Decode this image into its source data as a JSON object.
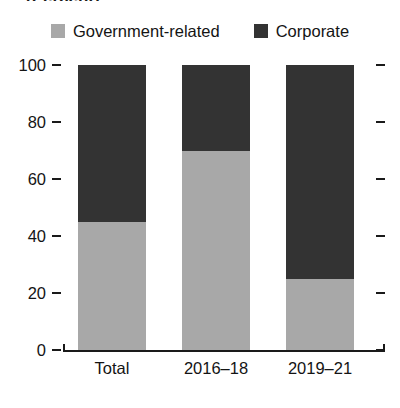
{
  "figure": {
    "units_title": "(Percent)"
  },
  "legend": {
    "position": "top-center",
    "items": [
      {
        "label": "Government-related",
        "color": "#a8a8a8",
        "swatch_name": "legend-swatch-government-related"
      },
      {
        "label": "Corporate",
        "color": "#333333",
        "swatch_name": "legend-swatch-corporate"
      }
    ]
  },
  "axes": {
    "y_ticks": [
      "100",
      "80",
      "60",
      "40",
      "20",
      "0"
    ],
    "x_ticks": [
      "Total",
      "2016–18",
      "2019–21"
    ]
  },
  "chart_data": {
    "type": "bar",
    "stacked": true,
    "orientation": "vertical",
    "title": "(Percent)",
    "xlabel": "",
    "ylabel": "",
    "ylim": [
      0,
      100
    ],
    "ytick_values": [
      0,
      20,
      40,
      60,
      80,
      100
    ],
    "grid": false,
    "legend_position": "top-center",
    "categories": [
      "Total",
      "2016–18",
      "2019–21"
    ],
    "series": [
      {
        "name": "Government-related",
        "color": "#a8a8a8",
        "values": [
          45,
          70,
          25
        ]
      },
      {
        "name": "Corporate",
        "color": "#333333",
        "values": [
          55,
          30,
          75
        ]
      }
    ]
  }
}
